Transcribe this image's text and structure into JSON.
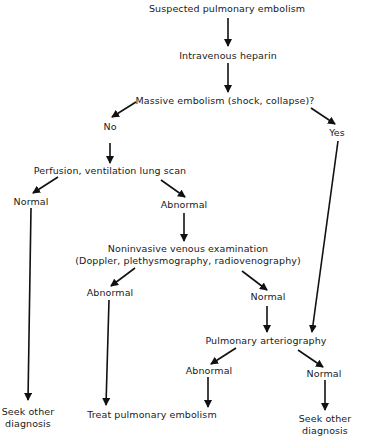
{
  "diagram": {
    "type": "flowchart",
    "nodes": {
      "start": "Suspected pulmonary embolism",
      "heparin": "Intravenous heparin",
      "massive": "Massive embolism (shock, collapse)?",
      "no": "No",
      "yes": "Yes",
      "scan": "Perfusion, ventilation lung scan",
      "scan_normal": "Normal",
      "scan_abnormal": "Abnormal",
      "venous_line1": "Noninvasive venous examination",
      "venous_line2": "(Doppler, plethysmography, radiovenography)",
      "venous_abnormal": "Abnormal",
      "venous_normal": "Normal",
      "arteriography": "Pulmonary arteriography",
      "art_abnormal": "Abnormal",
      "art_normal": "Normal",
      "seek1_line1": "Seek other",
      "seek1_line2": "diagnosis",
      "treat": "Treat pulmonary embolism",
      "seek2_line1": "Seek other",
      "seek2_line2": "diagnosis"
    },
    "edges": [
      [
        "start",
        "heparin"
      ],
      [
        "heparin",
        "massive"
      ],
      [
        "massive",
        "no"
      ],
      [
        "massive",
        "yes"
      ],
      [
        "no",
        "scan"
      ],
      [
        "scan",
        "scan_normal"
      ],
      [
        "scan",
        "scan_abnormal"
      ],
      [
        "scan_normal",
        "seek1"
      ],
      [
        "scan_abnormal",
        "venous"
      ],
      [
        "venous",
        "venous_abnormal"
      ],
      [
        "venous",
        "venous_normal"
      ],
      [
        "venous_abnormal",
        "treat"
      ],
      [
        "venous_normal",
        "arteriography"
      ],
      [
        "yes",
        "arteriography"
      ],
      [
        "arteriography",
        "art_abnormal"
      ],
      [
        "arteriography",
        "art_normal"
      ],
      [
        "art_abnormal",
        "treat"
      ],
      [
        "art_normal",
        "seek2"
      ]
    ],
    "line_color": "#111111"
  }
}
